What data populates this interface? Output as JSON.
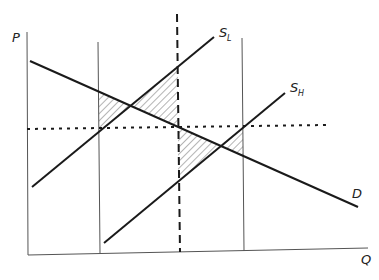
{
  "diagram": {
    "type": "supply-demand",
    "axes": {
      "y_label": "P",
      "x_label": "Q"
    },
    "curves": [
      {
        "id": "demand",
        "label": "D",
        "label_sub": ""
      },
      {
        "id": "supply-low",
        "label": "S",
        "label_sub": "L"
      },
      {
        "id": "supply-high",
        "label": "S",
        "label_sub": "H"
      }
    ],
    "reference_lines": [
      {
        "id": "quantity-bound-left",
        "style": "solid-thin"
      },
      {
        "id": "quantity-bound-right",
        "style": "solid-thin"
      },
      {
        "id": "mean-quantity",
        "style": "dashed"
      },
      {
        "id": "mean-price",
        "style": "dotted"
      }
    ],
    "shaded_regions": [
      {
        "id": "welfare-triangle-1",
        "pattern": "hatched"
      },
      {
        "id": "welfare-triangle-2",
        "pattern": "hatched"
      },
      {
        "id": "welfare-triangle-3",
        "pattern": "hatched"
      },
      {
        "id": "welfare-triangle-4",
        "pattern": "hatched"
      }
    ],
    "colors": {
      "line": "#1a1a1a",
      "thin_line": "#555555",
      "hatch": "#444444",
      "background": "#ffffff"
    }
  }
}
